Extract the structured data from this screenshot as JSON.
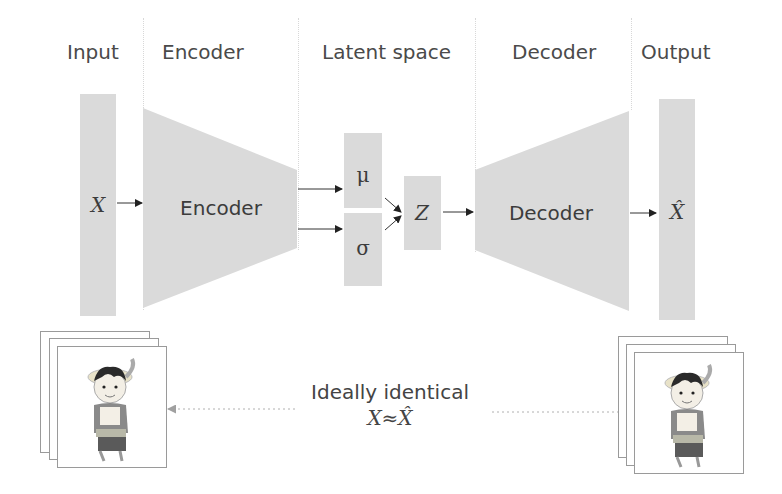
{
  "headers": {
    "input": "Input",
    "encoder": "Encoder",
    "latent": "Latent space",
    "decoder": "Decoder",
    "output": "Output"
  },
  "blocks": {
    "input_symbol": "X",
    "encoder_label": "Encoder",
    "mu_symbol": "μ",
    "sigma_symbol": "σ",
    "z_symbol": "Z",
    "decoder_label": "Decoder",
    "output_symbol": "X̂"
  },
  "caption": {
    "text": "Ideally identical",
    "equation": "X≈X̂"
  },
  "images": {
    "input_stack": "character-image-stack",
    "output_stack": "character-image-stack"
  },
  "colors": {
    "block_fill": "#dadada",
    "arrow": "#333333",
    "dotted_arrow": "#a8a8a8",
    "text": "#404040"
  }
}
